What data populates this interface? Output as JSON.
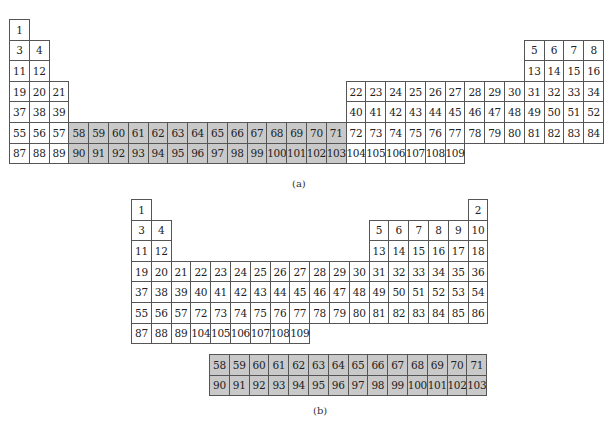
{
  "figure_a": {
    "caption": "(a)",
    "origin": {
      "x": 9,
      "y": 19
    },
    "cell_w": 19.8,
    "cell_h": 20.6,
    "cells": [
      {
        "n": "1",
        "c": 0,
        "r": 0
      },
      {
        "n": "3",
        "c": 0,
        "r": 1
      },
      {
        "n": "4",
        "c": 1,
        "r": 1
      },
      {
        "n": "11",
        "c": 0,
        "r": 2
      },
      {
        "n": "12",
        "c": 1,
        "r": 2
      },
      {
        "n": "19",
        "c": 0,
        "r": 3
      },
      {
        "n": "20",
        "c": 1,
        "r": 3
      },
      {
        "n": "21",
        "c": 2,
        "r": 3
      },
      {
        "n": "37",
        "c": 0,
        "r": 4
      },
      {
        "n": "38",
        "c": 1,
        "r": 4
      },
      {
        "n": "39",
        "c": 2,
        "r": 4
      },
      {
        "n": "55",
        "c": 0,
        "r": 5
      },
      {
        "n": "56",
        "c": 1,
        "r": 5
      },
      {
        "n": "57",
        "c": 2,
        "r": 5
      },
      {
        "n": "87",
        "c": 0,
        "r": 6
      },
      {
        "n": "88",
        "c": 1,
        "r": 6
      },
      {
        "n": "89",
        "c": 2,
        "r": 6
      },
      {
        "n": "58",
        "c": 3,
        "r": 5,
        "s": 1
      },
      {
        "n": "59",
        "c": 4,
        "r": 5,
        "s": 1
      },
      {
        "n": "60",
        "c": 5,
        "r": 5,
        "s": 1
      },
      {
        "n": "61",
        "c": 6,
        "r": 5,
        "s": 1
      },
      {
        "n": "62",
        "c": 7,
        "r": 5,
        "s": 1
      },
      {
        "n": "63",
        "c": 8,
        "r": 5,
        "s": 1
      },
      {
        "n": "64",
        "c": 9,
        "r": 5,
        "s": 1
      },
      {
        "n": "65",
        "c": 10,
        "r": 5,
        "s": 1
      },
      {
        "n": "66",
        "c": 11,
        "r": 5,
        "s": 1
      },
      {
        "n": "67",
        "c": 12,
        "r": 5,
        "s": 1
      },
      {
        "n": "68",
        "c": 13,
        "r": 5,
        "s": 1
      },
      {
        "n": "69",
        "c": 14,
        "r": 5,
        "s": 1
      },
      {
        "n": "70",
        "c": 15,
        "r": 5,
        "s": 1
      },
      {
        "n": "71",
        "c": 16,
        "r": 5,
        "s": 1
      },
      {
        "n": "90",
        "c": 3,
        "r": 6,
        "s": 1
      },
      {
        "n": "91",
        "c": 4,
        "r": 6,
        "s": 1
      },
      {
        "n": "92",
        "c": 5,
        "r": 6,
        "s": 1
      },
      {
        "n": "93",
        "c": 6,
        "r": 6,
        "s": 1
      },
      {
        "n": "94",
        "c": 7,
        "r": 6,
        "s": 1
      },
      {
        "n": "95",
        "c": 8,
        "r": 6,
        "s": 1
      },
      {
        "n": "96",
        "c": 9,
        "r": 6,
        "s": 1
      },
      {
        "n": "97",
        "c": 10,
        "r": 6,
        "s": 1
      },
      {
        "n": "98",
        "c": 11,
        "r": 6,
        "s": 1
      },
      {
        "n": "99",
        "c": 12,
        "r": 6,
        "s": 1
      },
      {
        "n": "100",
        "c": 13,
        "r": 6,
        "s": 1
      },
      {
        "n": "101",
        "c": 14,
        "r": 6,
        "s": 1
      },
      {
        "n": "102",
        "c": 15,
        "r": 6,
        "s": 1
      },
      {
        "n": "103",
        "c": 16,
        "r": 6,
        "s": 1
      },
      {
        "n": "22",
        "c": 17,
        "r": 3
      },
      {
        "n": "23",
        "c": 18,
        "r": 3
      },
      {
        "n": "24",
        "c": 19,
        "r": 3
      },
      {
        "n": "25",
        "c": 20,
        "r": 3
      },
      {
        "n": "26",
        "c": 21,
        "r": 3
      },
      {
        "n": "27",
        "c": 22,
        "r": 3
      },
      {
        "n": "28",
        "c": 23,
        "r": 3
      },
      {
        "n": "29",
        "c": 24,
        "r": 3
      },
      {
        "n": "30",
        "c": 25,
        "r": 3
      },
      {
        "n": "40",
        "c": 17,
        "r": 4
      },
      {
        "n": "41",
        "c": 18,
        "r": 4
      },
      {
        "n": "42",
        "c": 19,
        "r": 4
      },
      {
        "n": "43",
        "c": 20,
        "r": 4
      },
      {
        "n": "44",
        "c": 21,
        "r": 4
      },
      {
        "n": "45",
        "c": 22,
        "r": 4
      },
      {
        "n": "46",
        "c": 23,
        "r": 4
      },
      {
        "n": "47",
        "c": 24,
        "r": 4
      },
      {
        "n": "48",
        "c": 25,
        "r": 4
      },
      {
        "n": "72",
        "c": 17,
        "r": 5
      },
      {
        "n": "73",
        "c": 18,
        "r": 5
      },
      {
        "n": "74",
        "c": 19,
        "r": 5
      },
      {
        "n": "75",
        "c": 20,
        "r": 5
      },
      {
        "n": "76",
        "c": 21,
        "r": 5
      },
      {
        "n": "77",
        "c": 22,
        "r": 5
      },
      {
        "n": "78",
        "c": 23,
        "r": 5
      },
      {
        "n": "79",
        "c": 24,
        "r": 5
      },
      {
        "n": "80",
        "c": 25,
        "r": 5
      },
      {
        "n": "104",
        "c": 17,
        "r": 6
      },
      {
        "n": "105",
        "c": 18,
        "r": 6
      },
      {
        "n": "106",
        "c": 19,
        "r": 6
      },
      {
        "n": "107",
        "c": 20,
        "r": 6
      },
      {
        "n": "108",
        "c": 21,
        "r": 6
      },
      {
        "n": "109",
        "c": 22,
        "r": 6
      },
      {
        "n": "5",
        "c": 26,
        "r": 1
      },
      {
        "n": "6",
        "c": 27,
        "r": 1
      },
      {
        "n": "7",
        "c": 28,
        "r": 1
      },
      {
        "n": "8",
        "c": 29,
        "r": 1
      },
      {
        "n": "13",
        "c": 26,
        "r": 2
      },
      {
        "n": "14",
        "c": 27,
        "r": 2
      },
      {
        "n": "15",
        "c": 28,
        "r": 2
      },
      {
        "n": "16",
        "c": 29,
        "r": 2
      },
      {
        "n": "31",
        "c": 26,
        "r": 3
      },
      {
        "n": "32",
        "c": 27,
        "r": 3
      },
      {
        "n": "33",
        "c": 28,
        "r": 3
      },
      {
        "n": "34",
        "c": 29,
        "r": 3
      },
      {
        "n": "49",
        "c": 26,
        "r": 4
      },
      {
        "n": "50",
        "c": 27,
        "r": 4
      },
      {
        "n": "51",
        "c": 28,
        "r": 4
      },
      {
        "n": "52",
        "c": 29,
        "r": 4
      },
      {
        "n": "81",
        "c": 26,
        "r": 5
      },
      {
        "n": "82",
        "c": 27,
        "r": 5
      },
      {
        "n": "83",
        "c": 28,
        "r": 5
      },
      {
        "n": "84",
        "c": 29,
        "r": 5
      }
    ]
  },
  "figure_b": {
    "caption": "(b)",
    "origin": {
      "x": 131,
      "y": 199
    },
    "cell_w": 19.8,
    "cell_h": 20.6,
    "cells": [
      {
        "n": "1",
        "c": 0,
        "r": 0
      },
      {
        "n": "2",
        "c": 17,
        "r": 0
      },
      {
        "n": "3",
        "c": 0,
        "r": 1
      },
      {
        "n": "4",
        "c": 1,
        "r": 1
      },
      {
        "n": "5",
        "c": 12,
        "r": 1
      },
      {
        "n": "6",
        "c": 13,
        "r": 1
      },
      {
        "n": "7",
        "c": 14,
        "r": 1
      },
      {
        "n": "8",
        "c": 15,
        "r": 1
      },
      {
        "n": "9",
        "c": 16,
        "r": 1
      },
      {
        "n": "10",
        "c": 17,
        "r": 1
      },
      {
        "n": "11",
        "c": 0,
        "r": 2
      },
      {
        "n": "12",
        "c": 1,
        "r": 2
      },
      {
        "n": "13",
        "c": 12,
        "r": 2
      },
      {
        "n": "14",
        "c": 13,
        "r": 2
      },
      {
        "n": "15",
        "c": 14,
        "r": 2
      },
      {
        "n": "16",
        "c": 15,
        "r": 2
      },
      {
        "n": "17",
        "c": 16,
        "r": 2
      },
      {
        "n": "18",
        "c": 17,
        "r": 2
      },
      {
        "n": "19",
        "c": 0,
        "r": 3
      },
      {
        "n": "20",
        "c": 1,
        "r": 3
      },
      {
        "n": "21",
        "c": 2,
        "r": 3
      },
      {
        "n": "22",
        "c": 3,
        "r": 3
      },
      {
        "n": "23",
        "c": 4,
        "r": 3
      },
      {
        "n": "24",
        "c": 5,
        "r": 3
      },
      {
        "n": "25",
        "c": 6,
        "r": 3
      },
      {
        "n": "26",
        "c": 7,
        "r": 3
      },
      {
        "n": "27",
        "c": 8,
        "r": 3
      },
      {
        "n": "28",
        "c": 9,
        "r": 3
      },
      {
        "n": "29",
        "c": 10,
        "r": 3
      },
      {
        "n": "30",
        "c": 11,
        "r": 3
      },
      {
        "n": "31",
        "c": 12,
        "r": 3
      },
      {
        "n": "32",
        "c": 13,
        "r": 3
      },
      {
        "n": "33",
        "c": 14,
        "r": 3
      },
      {
        "n": "34",
        "c": 15,
        "r": 3
      },
      {
        "n": "35",
        "c": 16,
        "r": 3
      },
      {
        "n": "36",
        "c": 17,
        "r": 3
      },
      {
        "n": "37",
        "c": 0,
        "r": 4
      },
      {
        "n": "38",
        "c": 1,
        "r": 4
      },
      {
        "n": "39",
        "c": 2,
        "r": 4
      },
      {
        "n": "40",
        "c": 3,
        "r": 4
      },
      {
        "n": "41",
        "c": 4,
        "r": 4
      },
      {
        "n": "42",
        "c": 5,
        "r": 4
      },
      {
        "n": "43",
        "c": 6,
        "r": 4
      },
      {
        "n": "44",
        "c": 7,
        "r": 4
      },
      {
        "n": "45",
        "c": 8,
        "r": 4
      },
      {
        "n": "46",
        "c": 9,
        "r": 4
      },
      {
        "n": "47",
        "c": 10,
        "r": 4
      },
      {
        "n": "48",
        "c": 11,
        "r": 4
      },
      {
        "n": "49",
        "c": 12,
        "r": 4
      },
      {
        "n": "50",
        "c": 13,
        "r": 4
      },
      {
        "n": "51",
        "c": 14,
        "r": 4
      },
      {
        "n": "52",
        "c": 15,
        "r": 4
      },
      {
        "n": "53",
        "c": 16,
        "r": 4
      },
      {
        "n": "54",
        "c": 17,
        "r": 4
      },
      {
        "n": "55",
        "c": 0,
        "r": 5
      },
      {
        "n": "56",
        "c": 1,
        "r": 5
      },
      {
        "n": "57",
        "c": 2,
        "r": 5
      },
      {
        "n": "72",
        "c": 3,
        "r": 5
      },
      {
        "n": "73",
        "c": 4,
        "r": 5
      },
      {
        "n": "74",
        "c": 5,
        "r": 5
      },
      {
        "n": "75",
        "c": 6,
        "r": 5
      },
      {
        "n": "76",
        "c": 7,
        "r": 5
      },
      {
        "n": "77",
        "c": 8,
        "r": 5
      },
      {
        "n": "78",
        "c": 9,
        "r": 5
      },
      {
        "n": "79",
        "c": 10,
        "r": 5
      },
      {
        "n": "80",
        "c": 11,
        "r": 5
      },
      {
        "n": "81",
        "c": 12,
        "r": 5
      },
      {
        "n": "82",
        "c": 13,
        "r": 5
      },
      {
        "n": "83",
        "c": 14,
        "r": 5
      },
      {
        "n": "84",
        "c": 15,
        "r": 5
      },
      {
        "n": "85",
        "c": 16,
        "r": 5
      },
      {
        "n": "86",
        "c": 17,
        "r": 5
      },
      {
        "n": "87",
        "c": 0,
        "r": 6
      },
      {
        "n": "88",
        "c": 1,
        "r": 6
      },
      {
        "n": "89",
        "c": 2,
        "r": 6
      },
      {
        "n": "104",
        "c": 3,
        "r": 6
      },
      {
        "n": "105",
        "c": 4,
        "r": 6
      },
      {
        "n": "106",
        "c": 5,
        "r": 6
      },
      {
        "n": "107",
        "c": 6,
        "r": 6
      },
      {
        "n": "108",
        "c": 7,
        "r": 6
      },
      {
        "n": "109",
        "c": 8,
        "r": 6
      }
    ],
    "f_block": {
      "origin": {
        "x": 209,
        "y": 354
      },
      "cells": [
        {
          "n": "58",
          "c": 0,
          "r": 0,
          "s": 1
        },
        {
          "n": "59",
          "c": 1,
          "r": 0,
          "s": 1
        },
        {
          "n": "60",
          "c": 2,
          "r": 0,
          "s": 1
        },
        {
          "n": "61",
          "c": 3,
          "r": 0,
          "s": 1
        },
        {
          "n": "62",
          "c": 4,
          "r": 0,
          "s": 1
        },
        {
          "n": "63",
          "c": 5,
          "r": 0,
          "s": 1
        },
        {
          "n": "64",
          "c": 6,
          "r": 0,
          "s": 1
        },
        {
          "n": "65",
          "c": 7,
          "r": 0,
          "s": 1
        },
        {
          "n": "66",
          "c": 8,
          "r": 0,
          "s": 1
        },
        {
          "n": "67",
          "c": 9,
          "r": 0,
          "s": 1
        },
        {
          "n": "68",
          "c": 10,
          "r": 0,
          "s": 1
        },
        {
          "n": "69",
          "c": 11,
          "r": 0,
          "s": 1
        },
        {
          "n": "70",
          "c": 12,
          "r": 0,
          "s": 1
        },
        {
          "n": "71",
          "c": 13,
          "r": 0,
          "s": 1
        },
        {
          "n": "90",
          "c": 0,
          "r": 1,
          "s": 1
        },
        {
          "n": "91",
          "c": 1,
          "r": 1,
          "s": 1
        },
        {
          "n": "92",
          "c": 2,
          "r": 1,
          "s": 1
        },
        {
          "n": "93",
          "c": 3,
          "r": 1,
          "s": 1
        },
        {
          "n": "94",
          "c": 4,
          "r": 1,
          "s": 1
        },
        {
          "n": "95",
          "c": 5,
          "r": 1,
          "s": 1
        },
        {
          "n": "96",
          "c": 6,
          "r": 1,
          "s": 1
        },
        {
          "n": "97",
          "c": 7,
          "r": 1,
          "s": 1
        },
        {
          "n": "98",
          "c": 8,
          "r": 1,
          "s": 1
        },
        {
          "n": "99",
          "c": 9,
          "r": 1,
          "s": 1
        },
        {
          "n": "100",
          "c": 10,
          "r": 1,
          "s": 1
        },
        {
          "n": "101",
          "c": 11,
          "r": 1,
          "s": 1
        },
        {
          "n": "102",
          "c": 12,
          "r": 1,
          "s": 1
        },
        {
          "n": "103",
          "c": 13,
          "r": 1,
          "s": 1
        }
      ]
    }
  },
  "colors": {
    "shaded_fill": "#c9c9c9",
    "border": "#555555",
    "background": "#ffffff"
  }
}
